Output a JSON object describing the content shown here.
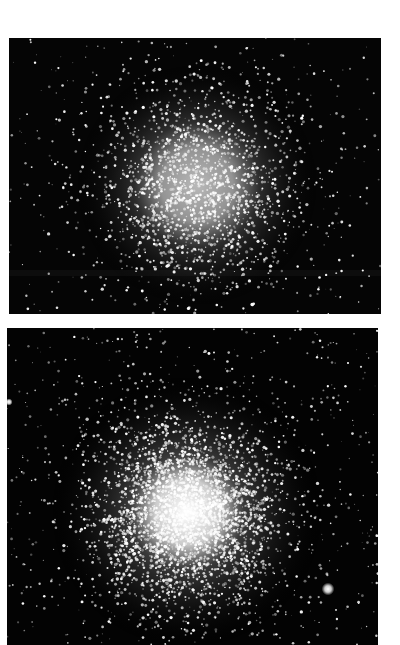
{
  "page": {
    "background": "#ffffff"
  },
  "photos": [
    {
      "name": "globular-cluster-photo-top",
      "box": {
        "x": 9,
        "y": 38,
        "w": 372,
        "h": 276
      },
      "background": "#050505",
      "cluster": {
        "cx": 188,
        "cy": 147,
        "core_radius": 42,
        "halo_radius": 120,
        "core_brightness": 0.72,
        "dense_stars": 1700,
        "field_stars": 380
      },
      "band_y": 232,
      "seed": 11,
      "bright_stars": []
    },
    {
      "name": "globular-cluster-photo-bottom",
      "box": {
        "x": 7,
        "y": 328,
        "w": 371,
        "h": 317
      },
      "background": "#030303",
      "cluster": {
        "cx": 180,
        "cy": 184,
        "core_radius": 38,
        "halo_radius": 135,
        "core_brightness": 1.0,
        "dense_stars": 3200,
        "field_stars": 700
      },
      "band_y": null,
      "seed": 29,
      "bright_stars": [
        {
          "x": 321,
          "y": 261,
          "r": 3.2
        },
        {
          "x": 2,
          "y": 74,
          "r": 1.8
        }
      ]
    }
  ]
}
